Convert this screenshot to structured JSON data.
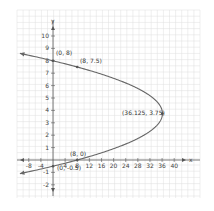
{
  "chart_data": {
    "type": "line",
    "title": "",
    "xlabel": "x",
    "ylabel": "y",
    "xlim": [
      -10,
      44
    ],
    "ylim": [
      -2.5,
      11
    ],
    "grid": true,
    "equation": "x = -2(y - 3.75)^2 + 36.125",
    "x_ticks": [
      "-8",
      "-4",
      "4",
      "8",
      "12",
      "16",
      "20",
      "24",
      "28",
      "32",
      "36",
      "40"
    ],
    "y_ticks": [
      "-2",
      "-1",
      "1",
      "2",
      "3",
      "4",
      "5",
      "6",
      "7",
      "8",
      "9",
      "10"
    ],
    "series": [
      {
        "name": "parabola",
        "description": "horizontal parabola opening left with arrows at both ends"
      }
    ],
    "points": [
      {
        "label": "(0, 8)",
        "x": 0,
        "y": 8
      },
      {
        "label": "(8, 7.5)",
        "x": 8,
        "y": 7.5
      },
      {
        "label": "(36.125, 3.75)",
        "x": 36.125,
        "y": 3.75
      },
      {
        "label": "(8, 0)",
        "x": 8,
        "y": 0
      },
      {
        "label": "(0, -0.5)",
        "x": 0,
        "y": -0.5
      }
    ]
  },
  "axes": {
    "x_name": "x",
    "y_name": "y"
  },
  "labels": {
    "p1": "(0, 8)",
    "p2": "(8, 7.5)",
    "vertex": "(36.125, 3.75)",
    "p4": "(8, 0)",
    "p5": "(0, -0.5)"
  },
  "ticks": {
    "x": [
      "-8",
      "-4",
      "4",
      "8",
      "12",
      "16",
      "20",
      "24",
      "28",
      "32",
      "36",
      "40"
    ],
    "y": [
      "-2",
      "-1",
      "1",
      "2",
      "3",
      "4",
      "5",
      "6",
      "7",
      "8",
      "9",
      "10"
    ]
  }
}
